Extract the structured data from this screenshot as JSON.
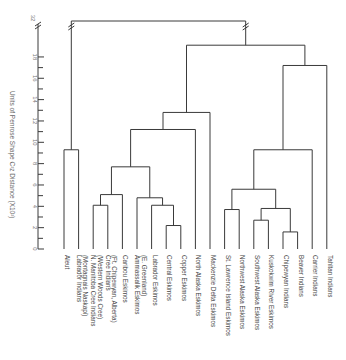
{
  "chart_data": {
    "type": "dendrogram",
    "title": "",
    "ylabel": "Units of Penrose Shape C²z Distance (X10²)",
    "xlabel": "",
    "y_ticks": [
      0,
      2,
      4,
      6,
      8,
      10,
      12,
      14,
      16,
      18,
      32
    ],
    "y_axis_break": "between 18 and 32",
    "ylim": [
      0,
      32
    ],
    "grid": false,
    "leaves": [
      "Aleut",
      "Labrador Indians (Montagnais Naskapi)",
      "N. Manitoba Cree Indians (Western Woods Cree)",
      "Cree Indians (Ft. Chipewyan, Alberta)",
      "Caribou Eskimos",
      "Ammassalik Eskimos (E. Greenland)",
      "Labrador Eskimos",
      "Central Eskimos",
      "Copper Eskimos",
      "North Alaska Eskimos",
      "Mackenzie Delta Eskimos",
      "St. Lawrence Island Eskimos",
      "Northwest Alaska Eskimos",
      "Southwest Alaska Eskimos",
      "Kuskokwim River Eskimos",
      "Chipewyan Indians",
      "Beaver Indians",
      "Carrier Indians",
      "Tahltan Indians"
    ],
    "merges": [
      {
        "id": "m1",
        "children": [
          "Aleut",
          "Labrador Indians (Montagnais Naskapi)"
        ],
        "height": 9.3
      },
      {
        "id": "m2",
        "children": [
          "N. Manitoba Cree Indians (Western Woods Cree)",
          "Cree Indians (Ft. Chipewyan, Alberta)"
        ],
        "height": 4.1
      },
      {
        "id": "m3",
        "children": [
          "m2",
          "Caribou Eskimos"
        ],
        "height": 5.1
      },
      {
        "id": "m4",
        "children": [
          "Central Eskimos",
          "Copper Eskimos"
        ],
        "height": 2.2
      },
      {
        "id": "m5",
        "children": [
          "Labrador Eskimos",
          "m4"
        ],
        "height": 4.1
      },
      {
        "id": "m6",
        "children": [
          "Ammassalik Eskimos (E. Greenland)",
          "m5"
        ],
        "height": 4.8
      },
      {
        "id": "m7",
        "children": [
          "m3",
          "m6"
        ],
        "height": 7.7
      },
      {
        "id": "m8",
        "children": [
          "m7",
          "North Alaska Eskimos"
        ],
        "height": 11.2
      },
      {
        "id": "m9",
        "children": [
          "m8",
          "Mackenzie Delta Eskimos"
        ],
        "height": 12.8
      },
      {
        "id": "m10",
        "children": [
          "St. Lawrence Island Eskimos",
          "Northwest Alaska Eskimos"
        ],
        "height": 3.7
      },
      {
        "id": "m11",
        "children": [
          "Southwest Alaska Eskimos",
          "Kuskokwim River Eskimos"
        ],
        "height": 2.7
      },
      {
        "id": "m12",
        "children": [
          "Chipewyan Indians",
          "Beaver Indians"
        ],
        "height": 1.6
      },
      {
        "id": "m13",
        "children": [
          "m11",
          "m12"
        ],
        "height": 3.8
      },
      {
        "id": "m14",
        "children": [
          "m10",
          "m13"
        ],
        "height": 5.6
      },
      {
        "id": "m15",
        "children": [
          "m14",
          "Carrier Indians"
        ],
        "height": 9.3
      },
      {
        "id": "m16",
        "children": [
          "m15",
          "Tahltan Indians"
        ],
        "height": 17.2
      },
      {
        "id": "m17",
        "children": [
          "m9",
          "m16"
        ],
        "height": 19.1
      },
      {
        "id": "m18",
        "children": [
          "m1",
          "m17"
        ],
        "height": 32
      }
    ]
  },
  "axis": {
    "title": "Units of Penrose Shape C²z Distance (X10²)",
    "break_label": "32"
  },
  "colors": {
    "line": "#3a3a3a",
    "text": "#444444",
    "axis_text": "#777777"
  }
}
